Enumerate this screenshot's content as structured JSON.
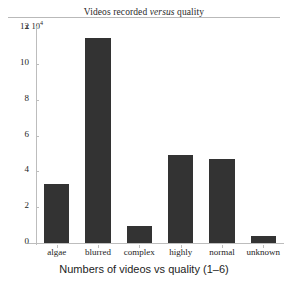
{
  "chart_data": {
    "type": "bar",
    "title": "Videos recorded versus quality",
    "title_parts": {
      "before": "Videos recorded ",
      "italic": "versus",
      "after": " quality"
    },
    "xlabel": "Numbers of videos vs quality (1–6)",
    "ylabel": "",
    "y_exponent_label": "x 10",
    "y_exponent_power": "4",
    "y_multiplier": 10000,
    "categories": [
      "algae",
      "blurred",
      "complex",
      "highly",
      "normal",
      "unknown"
    ],
    "values": [
      3.3,
      11.45,
      0.95,
      4.9,
      4.7,
      0.4
    ],
    "values_absolute": [
      33000,
      114500,
      9500,
      49000,
      47000,
      4000
    ],
    "ylim": [
      0,
      12
    ],
    "yticks": [
      0,
      2,
      4,
      6,
      8,
      10,
      12
    ],
    "ytick_labels": [
      "0",
      "2",
      "4",
      "6",
      "8",
      "10",
      "12"
    ],
    "grid": false,
    "legend": false,
    "bar_color": "#333333",
    "axis_color": "#bdbdbd",
    "background": "#ffffff"
  }
}
